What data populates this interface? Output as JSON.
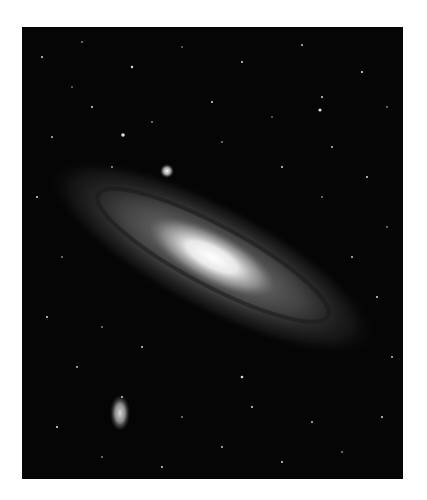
{
  "image": {
    "subject": "Spiral galaxy (Andromeda-like) with surrounding starfield",
    "alt": "Black and white photograph of a large tilted spiral galaxy with a bright core, a small elliptical companion galaxy at lower left and a bright compact companion above the core, set against a dense field of stars",
    "colors": {
      "background": "#050505",
      "core": "#f4f4f4",
      "disk": "#8a8a8a",
      "page": "#ffffff"
    }
  }
}
